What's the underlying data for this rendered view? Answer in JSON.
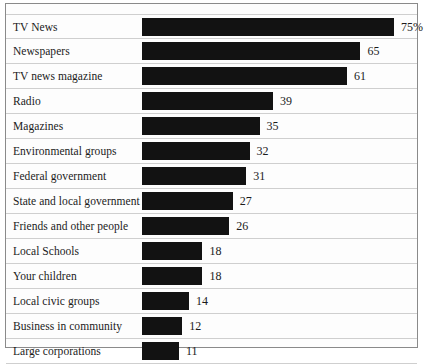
{
  "chart_data": {
    "type": "bar",
    "orientation": "horizontal",
    "title": "",
    "subtitle": "",
    "xlabel": "",
    "ylabel": "",
    "grid": false,
    "legend": null,
    "xlim": [
      0,
      82
    ],
    "unit": "percent",
    "categories": [
      "TV News",
      "Newspapers",
      "TV news magazine",
      "Radio",
      "Magazines",
      "Environmental groups",
      "Federal government",
      "State and local government",
      "Friends and other people",
      "Local Schools",
      "Your children",
      "Local civic groups",
      "Business in community",
      "Large corporations"
    ],
    "values": [
      75,
      65,
      61,
      39,
      35,
      32,
      31,
      27,
      26,
      18,
      18,
      14,
      12,
      11
    ],
    "value_labels": [
      "75%",
      "65",
      "61",
      "39",
      "35",
      "32",
      "31",
      "27",
      "26",
      "18",
      "18",
      "14",
      "12",
      "11"
    ],
    "bar_color": "#121212",
    "rows": [
      {
        "label": "TV News",
        "value": 75,
        "value_label": "75%"
      },
      {
        "label": "Newspapers",
        "value": 65,
        "value_label": "65"
      },
      {
        "label": "TV news magazine",
        "value": 61,
        "value_label": "61"
      },
      {
        "label": "Radio",
        "value": 39,
        "value_label": "39"
      },
      {
        "label": "Magazines",
        "value": 35,
        "value_label": "35"
      },
      {
        "label": "Environmental groups",
        "value": 32,
        "value_label": "32"
      },
      {
        "label": "Federal government",
        "value": 31,
        "value_label": "31"
      },
      {
        "label": "State and local government",
        "value": 27,
        "value_label": "27"
      },
      {
        "label": "Friends and other people",
        "value": 26,
        "value_label": "26"
      },
      {
        "label": "Local Schools",
        "value": 18,
        "value_label": "18"
      },
      {
        "label": "Your children",
        "value": 18,
        "value_label": "18"
      },
      {
        "label": "Local civic groups",
        "value": 14,
        "value_label": "14"
      },
      {
        "label": "Business in community",
        "value": 12,
        "value_label": "12"
      },
      {
        "label": "Large corporations",
        "value": 11,
        "value_label": "11"
      }
    ]
  }
}
